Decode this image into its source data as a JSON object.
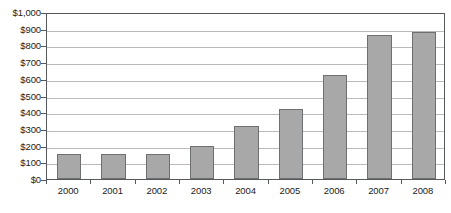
{
  "chart_data": {
    "type": "bar",
    "title": "",
    "subtitle": "",
    "xlabel": "",
    "ylabel": "",
    "categories": [
      "2000",
      "2001",
      "2002",
      "2003",
      "2004",
      "2005",
      "2006",
      "2007",
      "2008"
    ],
    "values": [
      150,
      148,
      150,
      195,
      320,
      420,
      620,
      860,
      880
    ],
    "series": [
      {
        "name": "",
        "values": [
          150,
          148,
          150,
          195,
          320,
          420,
          620,
          860,
          880
        ]
      }
    ],
    "ylim": [
      0,
      1000
    ],
    "ytick_values": [
      0,
      100,
      200,
      300,
      400,
      500,
      600,
      700,
      800,
      900,
      1000
    ],
    "ytick_labels": [
      "$0",
      "$100",
      "$200",
      "$300",
      "$400",
      "$500",
      "$600",
      "$700",
      "$800",
      "$900",
      "$1,000"
    ],
    "grid": true,
    "grid_axis": "y",
    "legend": false,
    "legend_position": "none",
    "annotations": [],
    "bar_color": "#a8a8a8",
    "bar_border_color": "#6d6f71",
    "gridline_color": "#b9bbbd",
    "axis_color": "#55595c",
    "background_color": "#ffffff",
    "text_color": "#1b1b1b"
  }
}
